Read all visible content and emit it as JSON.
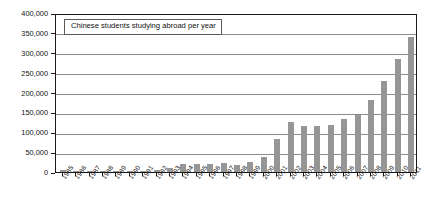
{
  "chart_data": {
    "type": "bar",
    "title": "Chinese students studying abroad per year",
    "xlabel": "",
    "ylabel": "",
    "ylim": [
      0,
      400000
    ],
    "ytick_step": 50000,
    "grid": true,
    "legend": "none",
    "bar_color": "#969696",
    "axis_color": "#1a1a1a",
    "gridline_color": "#8c8c8c",
    "categories": [
      "1985",
      "1986",
      "1987",
      "1988",
      "1989",
      "1990",
      "1991",
      "1992",
      "1993",
      "1994",
      "1995",
      "1996",
      "1997",
      "1998",
      "1999",
      "2000",
      "2001",
      "2002",
      "2003",
      "2004",
      "2005",
      "2006",
      "2007",
      "2008",
      "2009",
      "2010",
      "2011"
    ],
    "values": [
      4000,
      3000,
      3000,
      3000,
      3000,
      3000,
      3000,
      6000,
      10000,
      19000,
      21000,
      21000,
      23000,
      18000,
      24000,
      39000,
      84000,
      125000,
      117000,
      115000,
      119000,
      134000,
      144000,
      180000,
      230000,
      285000,
      340000
    ],
    "ytick_labels": [
      "0",
      "50,000",
      "100,000",
      "150,000",
      "200,000",
      "250,000",
      "300,000",
      "350,000",
      "400,000"
    ]
  },
  "chart": {
    "title_text": "Chinese students studying abroad per year"
  }
}
